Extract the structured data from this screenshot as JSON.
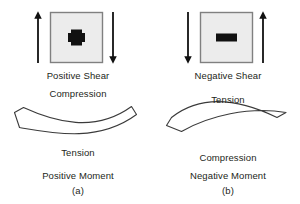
{
  "figure": {
    "title_text": "",
    "background_color": "#ffffff",
    "ink_color": "#231f20",
    "block_fill_color": "#ececec",
    "block_stroke_color": "#808080",
    "arrow_color": "#111111"
  },
  "panel_a": {
    "id": "(a)",
    "shear": {
      "sign_glyph": "+",
      "sign_name": "plus-sign",
      "label": "Positive Shear",
      "left_arrow_direction": "up",
      "right_arrow_direction": "down"
    },
    "beam": {
      "curvature": "sagging",
      "top_label": "Compression",
      "bottom_label": "Tension"
    },
    "moment_label": "Positive Moment",
    "caption": "(a)"
  },
  "panel_b": {
    "id": "(b)",
    "shear": {
      "sign_glyph": "−",
      "sign_name": "minus-sign",
      "label": "Negative Shear",
      "left_arrow_direction": "down",
      "right_arrow_direction": "up"
    },
    "beam": {
      "curvature": "hogging",
      "top_label": "Tension",
      "bottom_label": "Compression"
    },
    "moment_label": "Negative Moment",
    "caption": "(b)"
  }
}
